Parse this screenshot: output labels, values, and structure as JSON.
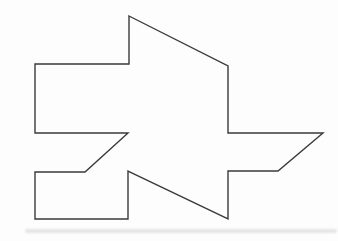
{
  "canvas": {
    "width": 338,
    "height": 241,
    "background": "#fdfdfd"
  },
  "figure": {
    "name": "irregular-polygon-outline",
    "stroke_color": "#3a3a3a",
    "stroke_width": 1.4,
    "fill": "none",
    "points": [
      [
        129,
        16
      ],
      [
        228,
        66
      ],
      [
        228,
        133
      ],
      [
        323,
        133
      ],
      [
        278,
        171
      ],
      [
        228,
        171
      ],
      [
        228,
        219
      ],
      [
        128,
        171
      ],
      [
        128,
        219
      ],
      [
        35,
        219
      ],
      [
        35,
        172
      ],
      [
        85,
        172
      ],
      [
        128,
        133
      ],
      [
        35,
        133
      ],
      [
        35,
        64
      ],
      [
        129,
        64
      ]
    ]
  },
  "artifacts": {
    "bottom_smudge": {
      "x": 25,
      "y": 229,
      "width": 312,
      "height": 4,
      "color": "rgba(175,175,175,0.30)"
    }
  }
}
